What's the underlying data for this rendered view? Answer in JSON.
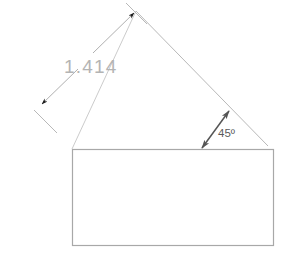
{
  "drawing": {
    "title": "45-degree rotated dimension with rectangle",
    "background_color": "#ffffff",
    "colors": {
      "rectangle_stroke": "#a8a8a8",
      "construction_line": "#b0b0b0",
      "dimension_line": "#9a9a9a",
      "arrowhead_fill": "#1a1a1a",
      "angle_arrow": "#555555",
      "dimension_text": "#b4b4b4",
      "angle_text": "#5b5b5b"
    },
    "labels": {
      "dimension_value": "1.414",
      "angle_value": "45º"
    },
    "geometry": {
      "rectangle": {
        "x": 72,
        "y": 149,
        "width": 202,
        "height": 97
      },
      "diagonal_main": {
        "x1": 136,
        "y1": 11,
        "x2": 268,
        "y2": 146
      },
      "diagonal_left": {
        "x1": 136,
        "y1": 11,
        "x2": 72,
        "y2": 149
      },
      "dimension_line_upper": {
        "x1": 94,
        "y1": 52,
        "x2": 125,
        "y2": 22
      },
      "dimension_line_lower": {
        "x1": 46,
        "y1": 100,
        "x2": 77,
        "y2": 70
      },
      "extension_tick_top": {
        "x1": 126,
        "y1": 3,
        "x2": 146,
        "y2": 23
      },
      "extension_tick_bottom": {
        "x1": 35,
        "y1": 111,
        "x2": 56,
        "y2": 131
      },
      "angle_arrow": {
        "x1": 202,
        "y1": 148,
        "x2": 229,
        "y2": 111
      }
    }
  }
}
